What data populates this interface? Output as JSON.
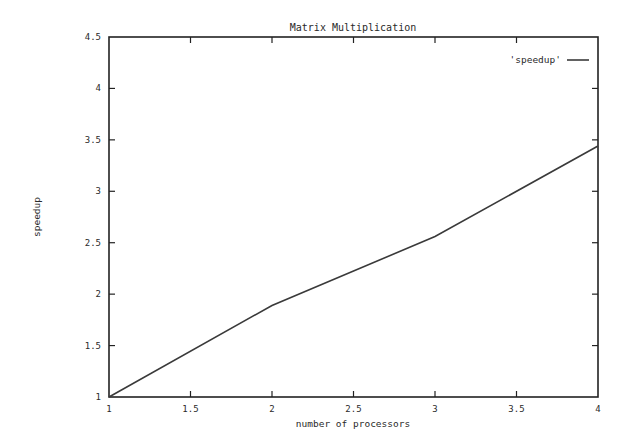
{
  "chart_data": {
    "type": "line",
    "title": "Matrix Multiplication",
    "xlabel": "number of processors",
    "ylabel": "speedup",
    "xlim": [
      1,
      4
    ],
    "ylim": [
      1,
      4.5
    ],
    "xticks": [
      "1",
      "1.5",
      "2",
      "2.5",
      "3",
      "3.5",
      "4"
    ],
    "yticks": [
      "1",
      "1.5",
      "2",
      "2.5",
      "3",
      "3.5",
      "4",
      "4.5"
    ],
    "grid": false,
    "legend_position": "top-right",
    "series": [
      {
        "name": "'speedup'",
        "x": [
          1,
          2,
          3,
          4
        ],
        "values": [
          1.0,
          1.89,
          2.56,
          3.44
        ]
      }
    ]
  },
  "colors": {
    "line": "#3a3a3a",
    "axis": "#222222",
    "background": "#ffffff"
  }
}
